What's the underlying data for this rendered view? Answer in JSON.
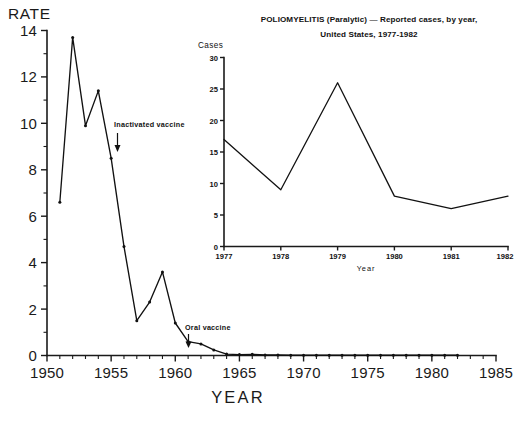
{
  "main_chart": {
    "ylabel": "RATE",
    "xlabel": "YEAR",
    "y_ticks": [
      "0",
      "2",
      "4",
      "6",
      "8",
      "10",
      "12",
      "14"
    ],
    "x_ticks": [
      "1950",
      "1955",
      "1960",
      "1965",
      "1970",
      "1975",
      "1980",
      "1985"
    ],
    "annotations": [
      {
        "label": "Inactivated vaccine",
        "year": 1955
      },
      {
        "label": "Oral vaccine",
        "year": 1961
      }
    ]
  },
  "inset_chart": {
    "title_line1": "POLIOMYELITIS (Paralytic) — Reported cases, by year,",
    "title_line2": "United States, 1977-1982",
    "ylabel": "Cases",
    "xlabel": "Year",
    "y_ticks": [
      "0",
      "5",
      "10",
      "15",
      "20",
      "25",
      "30"
    ],
    "x_ticks": [
      "1977",
      "1978",
      "1979",
      "1980",
      "1981",
      "1982"
    ]
  },
  "colors": {
    "line": "#111111",
    "axis": "#1a1a1a",
    "background": "#ffffff"
  },
  "chart_data": [
    {
      "type": "line",
      "id": "main",
      "title": "",
      "xlabel": "YEAR",
      "ylabel": "RATE",
      "xlim": [
        1950,
        1985
      ],
      "ylim": [
        0,
        14
      ],
      "grid": false,
      "legend": "none",
      "x": [
        1951,
        1952,
        1953,
        1954,
        1955,
        1956,
        1957,
        1958,
        1959,
        1960,
        1961,
        1962,
        1963,
        1964,
        1965,
        1966,
        1967,
        1968,
        1969,
        1970,
        1971,
        1972,
        1973,
        1974,
        1975,
        1976,
        1977,
        1978,
        1979,
        1980,
        1981,
        1982
      ],
      "values": [
        6.6,
        13.7,
        9.9,
        11.4,
        8.5,
        4.7,
        1.5,
        2.3,
        3.6,
        1.4,
        0.6,
        0.5,
        0.24,
        0.06,
        0.04,
        0.05,
        0.02,
        0.02,
        0.01,
        0.01,
        0.01,
        0.01,
        0.01,
        0.01,
        0.01,
        0.01,
        0.01,
        0.01,
        0.01,
        0.01,
        0.01,
        0.01
      ],
      "annotations": [
        {
          "text": "Inactivated vaccine",
          "x": 1955,
          "y": 8.5
        },
        {
          "text": "Oral vaccine",
          "x": 1961,
          "y": 0.6
        }
      ]
    },
    {
      "type": "line",
      "id": "inset",
      "title": "POLIOMYELITIS (Paralytic) — Reported cases, by year, United States, 1977-1982",
      "xlabel": "Year",
      "ylabel": "Cases",
      "xlim": [
        1977,
        1982
      ],
      "ylim": [
        0,
        30
      ],
      "grid": false,
      "legend": "none",
      "categories": [
        "1977",
        "1978",
        "1979",
        "1980",
        "1981",
        "1982"
      ],
      "x": [
        1977,
        1978,
        1979,
        1980,
        1981,
        1982
      ],
      "values": [
        17,
        9,
        26,
        8,
        6,
        8
      ]
    }
  ]
}
